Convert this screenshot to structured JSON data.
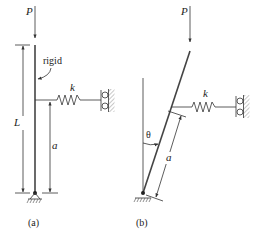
{
  "figure": {
    "panels": [
      {
        "id": "a",
        "caption": "(a)",
        "labels": {
          "load": "P",
          "spring": "k",
          "member": "rigid",
          "total_length": "L",
          "spring_height": "a"
        }
      },
      {
        "id": "b",
        "caption": "(b)",
        "labels": {
          "load": "P",
          "spring": "k",
          "angle": "θ",
          "spring_height": "a"
        }
      }
    ]
  }
}
